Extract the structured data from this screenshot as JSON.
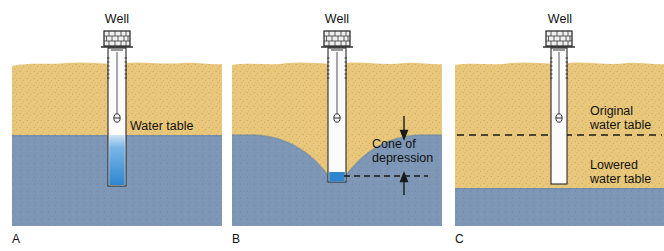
{
  "figure": {
    "colors": {
      "sand": "#e9c87c",
      "sand_speckle": "#c9a košice",
      "water": "#7e97b6",
      "water_deep": "#7890ad",
      "pipe_water": "#3f8fd0",
      "pipe_white": "#fbfbfb",
      "outline": "#1a1a1a",
      "background": "#ffffff"
    }
  },
  "panels": [
    {
      "id": "A",
      "letter": "A",
      "well_label": "Well",
      "labels": [
        {
          "name": "water-table",
          "text": "Water table"
        }
      ],
      "water_table_y": 135,
      "well_bottom_y": 186,
      "description": "Static water level; well pipe filled with water from the water table down."
    },
    {
      "id": "B",
      "letter": "B",
      "well_label": "Well",
      "labels": [
        {
          "name": "cone-of-depression",
          "text": "Cone of\ndepression"
        }
      ],
      "water_table_y": 135,
      "cone_bottom_y": 178,
      "well_bottom_y": 182,
      "description": "Pumping creates a cone of depression; arrows mark the drawdown."
    },
    {
      "id": "C",
      "letter": "C",
      "well_label": "Well",
      "labels": [
        {
          "name": "original-water-table",
          "text": "Original\nwater table"
        },
        {
          "name": "lowered-water-table",
          "text": "Lowered\nwater table"
        }
      ],
      "original_water_table_y": 135,
      "lowered_water_table_y": 188,
      "well_bottom_y": 184,
      "description": "Water table has dropped below the bottom of the well; the well is dry."
    }
  ]
}
